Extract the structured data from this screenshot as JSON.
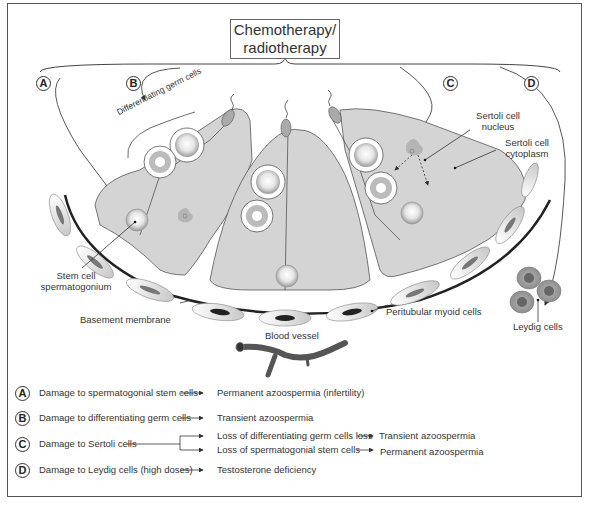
{
  "title": {
    "line1": "Chemotherapy/",
    "line2": "radiotherapy"
  },
  "markers": {
    "A": "A",
    "B": "B",
    "C": "C",
    "D": "D"
  },
  "labels": {
    "differentiating_germ_cells": "Differentiating germ cells",
    "sertoli_nucleus_1": "Sertoli cell",
    "sertoli_nucleus_2": "nucleus",
    "sertoli_cytoplasm_1": "Sertoli cell",
    "sertoli_cytoplasm_2": "cytoplasm",
    "stem_cell_1": "Stem cell",
    "stem_cell_2": "spermatogonium",
    "basement_membrane": "Basement membrane",
    "peritubular_myoid": "Peritubular myoid cells",
    "leydig_cells": "Leydig cells",
    "blood_vessel": "Blood vessel"
  },
  "legend": [
    {
      "marker": "A",
      "cause": "Damage to spermatogonial stem cells",
      "effects": [
        {
          "text": "Permanent azoospermia (infertility)",
          "outcome": null
        }
      ]
    },
    {
      "marker": "B",
      "cause": "Damage to differentiating germ cells",
      "effects": [
        {
          "text": "Transient azoospermia",
          "outcome": null
        }
      ]
    },
    {
      "marker": "C",
      "cause": "Damage to Sertoli cells",
      "effects": [
        {
          "text": "Loss of differentiating germ cells loss",
          "outcome": "Transient azoospermia"
        },
        {
          "text": "Loss of spermatogonial stem cells",
          "outcome": "Permanent azoospermia"
        }
      ]
    },
    {
      "marker": "D",
      "cause": "Damage to Leydig cells (high doses)",
      "effects": [
        {
          "text": "Testosterone deficiency",
          "outcome": null
        }
      ]
    }
  ],
  "colors": {
    "sertoli_fill": "#d4d4d4",
    "outline": "#444444",
    "leydig_fill": "#9a9a9a",
    "vessel": "#5a5a5a"
  }
}
